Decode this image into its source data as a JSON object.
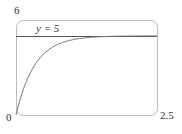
{
  "chart_data": {
    "type": "line",
    "title": "",
    "xlabel": "",
    "ylabel": "",
    "xlim": [
      0,
      2.5
    ],
    "ylim": [
      0,
      6
    ],
    "grid": false,
    "tick_labels": {
      "x_min": "0",
      "x_max": "2.5",
      "y_max": "6"
    },
    "series": [
      {
        "name": "curve",
        "formula": "y = 5(1 - e^(-3x))",
        "x": [
          0,
          0.25,
          0.5,
          0.75,
          1.0,
          1.5,
          2.0,
          2.5
        ],
        "y": [
          0,
          2.64,
          3.88,
          4.47,
          4.75,
          4.94,
          4.99,
          5.0
        ]
      },
      {
        "name": "asymptote",
        "x": [
          0,
          2.5
        ],
        "y": [
          5,
          5
        ]
      }
    ],
    "annotations": [
      {
        "text": "y = 5",
        "x": 0.2,
        "y": 5
      }
    ]
  },
  "labels": {
    "y_max": "6",
    "origin": "0",
    "x_max": "2.5",
    "asymptote": "y = 5"
  }
}
